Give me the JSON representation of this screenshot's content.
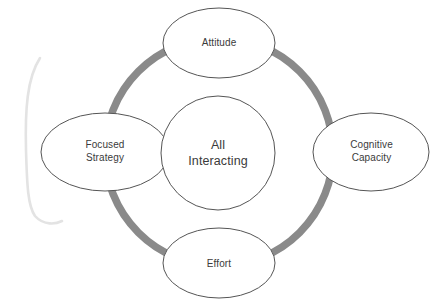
{
  "diagram": {
    "type": "cycle-ring",
    "title": "",
    "center": {
      "id": "all-interacting",
      "label": "All\nInteracting",
      "shape": "circle",
      "fill": "#ffffff",
      "stroke": "#555555"
    },
    "ring": {
      "color": "#8a8a8a",
      "thickness": "7px",
      "shape": "circle"
    },
    "nodes": [
      {
        "id": "attitude",
        "label": "Attitude",
        "position": "top",
        "shape": "ellipse",
        "fill": "#ffffff",
        "stroke": "#555555"
      },
      {
        "id": "cognitive-capacity",
        "label": "Cognitive\nCapacity",
        "position": "right",
        "shape": "ellipse",
        "fill": "#ffffff",
        "stroke": "#555555"
      },
      {
        "id": "effort",
        "label": "Effort",
        "position": "bottom",
        "shape": "ellipse",
        "fill": "#ffffff",
        "stroke": "#555555"
      },
      {
        "id": "focused-strategy",
        "label": "Focused\nStrategy",
        "position": "left",
        "shape": "ellipse",
        "fill": "#ffffff",
        "stroke": "#555555"
      }
    ],
    "artifact": {
      "id": "left-bracket-mark",
      "color": "#e2e2e2"
    },
    "colors": {
      "background": "#ffffff",
      "text": "#3b3b3b",
      "outline": "#555555",
      "ring": "#8a8a8a"
    }
  }
}
